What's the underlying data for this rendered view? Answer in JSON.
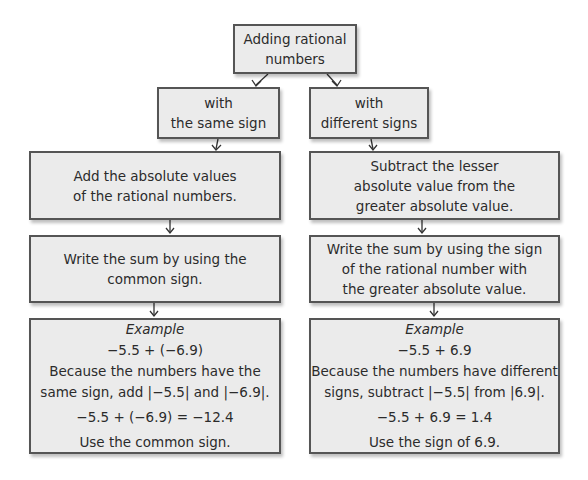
{
  "title": "Adding rational numbers",
  "root": {
    "lines": [
      "Adding rational",
      "numbers"
    ]
  },
  "same_sign": {
    "header": {
      "lines": [
        "with",
        "the same sign"
      ]
    },
    "step1": {
      "lines": [
        "Add the absolute values",
        "of the rational numbers."
      ]
    },
    "step2": {
      "lines": [
        "Write the sum by using the",
        "common sign."
      ]
    },
    "example": {
      "label": "Example",
      "expression": "−5.5 + (−6.9)",
      "explanation": [
        "Because the numbers have the",
        "same sign, add |−5.5| and |−6.9|."
      ],
      "result": "−5.5 + (−6.9) = −12.4",
      "note": "Use the common sign."
    }
  },
  "different_signs": {
    "header": {
      "lines": [
        "with",
        "different signs"
      ]
    },
    "step1": {
      "lines": [
        "Subtract the lesser",
        "absolute value from the",
        "greater absolute value."
      ]
    },
    "step2": {
      "lines": [
        "Write the sum by using the sign",
        "of the rational number with",
        "the greater absolute value."
      ]
    },
    "example": {
      "label": "Example",
      "expression": "−5.5 + 6.9",
      "explanation": [
        "Because the numbers have different",
        "signs, subtract |−5.5| from |6.9|."
      ],
      "result": "−5.5 + 6.9 = 1.4",
      "note": "Use the sign of 6.9."
    }
  },
  "colors": {
    "box_fill": "#ebebeb",
    "box_border": "#555555",
    "text": "#2b2b2b"
  }
}
